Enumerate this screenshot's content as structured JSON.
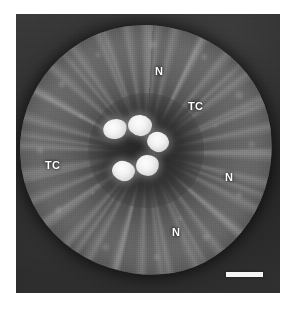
{
  "figure": {
    "type": "light-micrograph",
    "alt": "Transverse section of a root showing cortex, stele with five bright xylem elements, nodules (N) and transfer cells (TC)",
    "background_color": "#ffffff",
    "panel_color": "#2e2e2e",
    "tissue_color": "#7a7a7a",
    "highlight_color": "#f6f6f6",
    "label_color": "#ffffff"
  },
  "panel": {
    "x": 16,
    "y": 14,
    "width": 264,
    "height": 279
  },
  "labels": [
    {
      "id": "n-top",
      "text": "N",
      "x": 155,
      "y": 66,
      "meaning": "nodule"
    },
    {
      "id": "tc-right",
      "text": "TC",
      "x": 188,
      "y": 101,
      "meaning": "transfer-cell"
    },
    {
      "id": "tc-left",
      "text": "TC",
      "x": 45,
      "y": 160,
      "meaning": "transfer-cell"
    },
    {
      "id": "n-right",
      "text": "N",
      "x": 225,
      "y": 172,
      "meaning": "nodule"
    },
    {
      "id": "n-bottom",
      "text": "N",
      "x": 172,
      "y": 227,
      "meaning": "nodule"
    }
  ],
  "vessels": [
    {
      "id": "vessel-1",
      "x": 103,
      "y": 119,
      "w": 24,
      "h": 20,
      "rot": -14
    },
    {
      "id": "vessel-2",
      "x": 128,
      "y": 115,
      "w": 24,
      "h": 21,
      "rot": 8
    },
    {
      "id": "vessel-3",
      "x": 147,
      "y": 132,
      "w": 22,
      "h": 20,
      "rot": 22
    },
    {
      "id": "vessel-4",
      "x": 136,
      "y": 155,
      "w": 23,
      "h": 21,
      "rot": -6
    },
    {
      "id": "vessel-5",
      "x": 112,
      "y": 161,
      "w": 23,
      "h": 20,
      "rot": 14
    }
  ],
  "scale_bar": {
    "x": 226,
    "y": 272,
    "length": 37,
    "thickness": 5,
    "color": "#f4f4f4",
    "caption": ""
  }
}
